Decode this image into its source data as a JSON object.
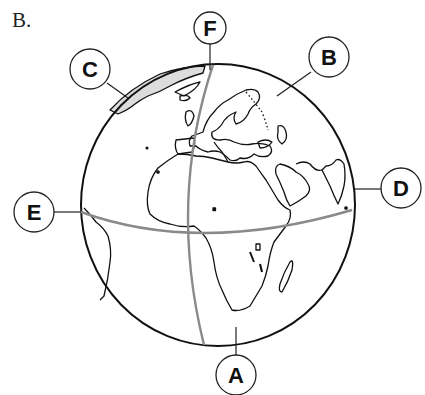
{
  "panel": {
    "letter": "B."
  },
  "globe": {
    "center": [
      218,
      205
    ],
    "rx": 137,
    "ry": 141,
    "outline_color": "#111111",
    "gridline_color": "#8a8a8a",
    "gridlines": [
      "equator",
      "prime-meridian"
    ],
    "continents_visible": [
      "Europe",
      "Africa",
      "Arabian Peninsula",
      "India",
      "Greenland",
      "South America (eastern tip)",
      "Madagascar"
    ]
  },
  "labels": [
    {
      "id": "A",
      "text": "A",
      "cx": 236,
      "cy": 375,
      "points_to": "south pole region on prime meridian side"
    },
    {
      "id": "B",
      "text": "B",
      "cx": 329,
      "cy": 57,
      "points_to": "northern Asia (inside globe)"
    },
    {
      "id": "C",
      "text": "C",
      "cx": 90,
      "cy": 69,
      "points_to": "globe edge near Greenland"
    },
    {
      "id": "D",
      "text": "D",
      "cx": 398,
      "cy": 188,
      "points_to": "eastern edge of globe near equator"
    },
    {
      "id": "E",
      "text": "E",
      "cx": 34,
      "cy": 212,
      "points_to": "western end of equator"
    },
    {
      "id": "F",
      "text": "F",
      "cx": 210,
      "cy": 28,
      "points_to": "north pole / top of prime meridian"
    }
  ]
}
